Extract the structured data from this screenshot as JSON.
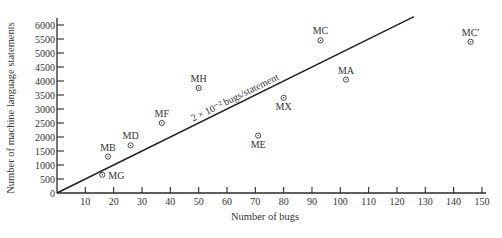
{
  "chart_data": {
    "type": "scatter",
    "title": "",
    "xlabel": "Number of bugs",
    "ylabel": "Number of machine language statements",
    "xlim": [
      0,
      150
    ],
    "ylim": [
      0,
      6000
    ],
    "xticks": [
      10,
      20,
      30,
      40,
      50,
      60,
      70,
      80,
      90,
      100,
      110,
      120,
      130,
      140,
      150
    ],
    "yticks": [
      0,
      500,
      1000,
      1500,
      2000,
      2500,
      3000,
      3500,
      4000,
      4500,
      5000,
      5500,
      6000
    ],
    "grid": false,
    "legend": null,
    "points": [
      {
        "label": "MG",
        "x": 16,
        "y": 650,
        "label_pos": "right"
      },
      {
        "label": "MB",
        "x": 18,
        "y": 1300,
        "label_pos": "above"
      },
      {
        "label": "MD",
        "x": 26,
        "y": 1700,
        "label_pos": "above"
      },
      {
        "label": "MF",
        "x": 37,
        "y": 2500,
        "label_pos": "above"
      },
      {
        "label": "MH",
        "x": 50,
        "y": 3750,
        "label_pos": "above"
      },
      {
        "label": "ME",
        "x": 71,
        "y": 2050,
        "label_pos": "below"
      },
      {
        "label": "MX",
        "x": 80,
        "y": 3400,
        "label_pos": "below"
      },
      {
        "label": "MC",
        "x": 93,
        "y": 5450,
        "label_pos": "above"
      },
      {
        "label": "MA",
        "x": 102,
        "y": 4050,
        "label_pos": "above"
      },
      {
        "label": "MC′",
        "x": 146,
        "y": 5400,
        "label_pos": "above"
      }
    ],
    "reference_line": {
      "label": "2 × 10⁻² bugs/statement",
      "slope_statements_per_bug": 50,
      "x0": 0,
      "y0": 0,
      "x1": 126,
      "y1": 6300
    }
  }
}
